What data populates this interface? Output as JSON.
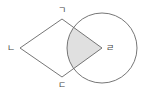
{
  "diagram": {
    "vertices": {
      "top": "ㄱ",
      "left": "ㄴ",
      "bottom": "ㄷ",
      "right": "ㄹ"
    },
    "circle_center_label": "ㄹ",
    "shaded_region": "intersection of rhombus and circle",
    "colors": {
      "stroke": "#666666",
      "shade": "#e0e0e0",
      "label": "#444444"
    }
  }
}
